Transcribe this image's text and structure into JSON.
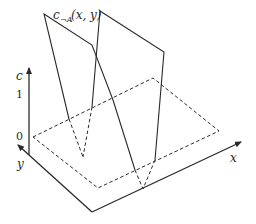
{
  "figure": {
    "surface_label": {
      "base": "c",
      "subscript": "¬A",
      "args": "(x, y)"
    },
    "axes": {
      "c": {
        "label": "c",
        "ticks": [
          "1",
          "0"
        ]
      },
      "x": {
        "label": "x"
      },
      "y": {
        "label": "y"
      }
    }
  }
}
